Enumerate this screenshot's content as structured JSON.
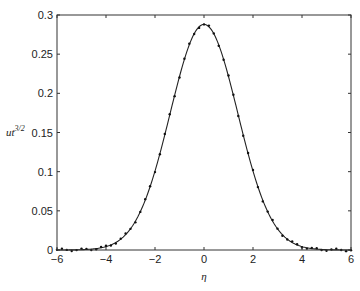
{
  "chart_data": {
    "type": "line",
    "title": "",
    "xlabel": "η",
    "ylabel": "ut^{3/2}",
    "ylabel_base": "ut",
    "ylabel_exp": "3/2",
    "xlim": [
      -6,
      6
    ],
    "ylim": [
      0,
      0.3
    ],
    "xticks": [
      -6,
      -4,
      -2,
      0,
      2,
      4,
      6
    ],
    "xtick_labels": [
      "−6",
      "−4",
      "−2",
      "0",
      "2",
      "4",
      "6"
    ],
    "yticks": [
      0,
      0.05,
      0.1,
      0.15,
      0.2,
      0.25,
      0.3
    ],
    "ytick_labels": [
      "0",
      "0.05",
      "0.1",
      "0.15",
      "0.2",
      "0.25",
      "0.3"
    ],
    "grid": false,
    "legend": null,
    "series": [
      {
        "name": "analytic",
        "style": "solid-line",
        "color": "#222222",
        "description": "Gaussian profile, peak ≈ 0.288 at η = 0, σ ≈ 1.38",
        "peak": 0.288,
        "sigma": 1.38
      },
      {
        "name": "numerical",
        "style": "dots",
        "color": "#111111",
        "x_start": -6,
        "x_end": 6,
        "x_step": 0.2,
        "description": "Sampled points lying on the Gaussian curve"
      }
    ]
  }
}
